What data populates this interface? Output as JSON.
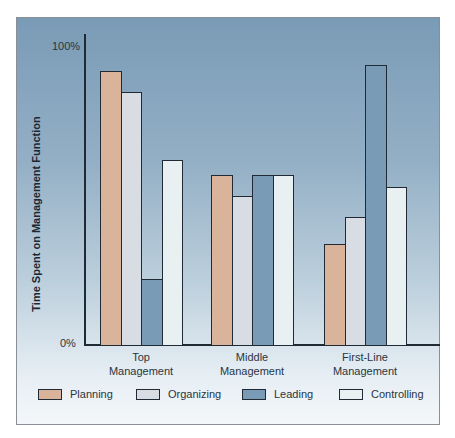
{
  "chart_data": {
    "type": "bar",
    "title": "",
    "xlabel": "",
    "ylabel": "Time Spent on Management Function",
    "ylim": [
      0,
      100
    ],
    "y_ticks": [
      "0%",
      "100%"
    ],
    "grid": false,
    "legend_position": "bottom",
    "categories": [
      "Top Management",
      "Middle Management",
      "First-Line Management"
    ],
    "category_lines": [
      [
        "Top",
        "Management"
      ],
      [
        "Middle",
        "Management"
      ],
      [
        "First-Line",
        "Management"
      ]
    ],
    "series": [
      {
        "name": "Planning",
        "color": "#d9b39a",
        "values": [
          92,
          57,
          34
        ]
      },
      {
        "name": "Organizing",
        "color": "#d8dde4",
        "values": [
          85,
          50,
          43
        ]
      },
      {
        "name": "Leading",
        "color": "#7a9bb6",
        "values": [
          22,
          57,
          94
        ]
      },
      {
        "name": "Controlling",
        "color": "#e8f0f2",
        "values": [
          62,
          57,
          53
        ]
      }
    ]
  }
}
